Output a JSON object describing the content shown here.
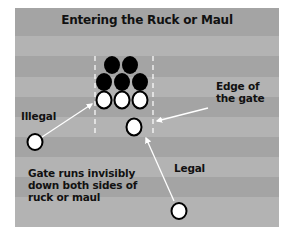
{
  "title": "Entering the Ruck or Maul",
  "labels": {
    "illegal": "Illegal",
    "legal": "Legal",
    "edge_line1": "Edge of",
    "edge_line2": "the gate",
    "note_line1": "Gate runs invisibly",
    "note_line2": "down both sides of",
    "note_line3": "ruck or maul"
  },
  "colors": {
    "stripe_dark": "#a4a4a4",
    "stripe_light": "#b3b3b3",
    "defending_players": "#000000",
    "attacking_players": "#ffffff",
    "arrows": "#ffffff",
    "gate_lines": "#ffffff"
  },
  "players": {
    "black": [
      {
        "cx": 112,
        "cy": 65
      },
      {
        "cx": 130,
        "cy": 65
      },
      {
        "cx": 104,
        "cy": 82
      },
      {
        "cx": 122,
        "cy": 82
      },
      {
        "cx": 140,
        "cy": 82
      }
    ],
    "white_ruck": [
      {
        "cx": 104,
        "cy": 100
      },
      {
        "cx": 122,
        "cy": 100
      },
      {
        "cx": 140,
        "cy": 100
      },
      {
        "cx": 134,
        "cy": 127
      }
    ],
    "illegal_entrant": {
      "cx": 35,
      "cy": 142
    },
    "legal_entrant": {
      "cx": 179,
      "cy": 211
    }
  }
}
